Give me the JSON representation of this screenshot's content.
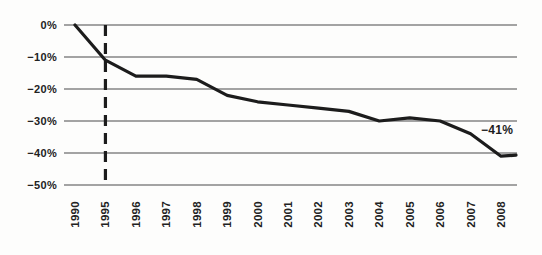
{
  "figure": {
    "background": "#fdfdfc",
    "title": ""
  },
  "chart_data": {
    "type": "line",
    "title": "",
    "xlabel": "",
    "ylabel": "",
    "categories": [
      "1990",
      "1995",
      "1996",
      "1997",
      "1998",
      "1999",
      "2000",
      "2001",
      "2002",
      "2003",
      "2004",
      "2005",
      "2006",
      "2007",
      "2008"
    ],
    "series": [
      {
        "name": "percent-change",
        "values": [
          0,
          -11,
          -16,
          -16,
          -17,
          -22,
          -24,
          -25,
          -26,
          -27,
          -30,
          -29,
          -30,
          -34,
          -41
        ]
      }
    ],
    "y_ticks": [
      0,
      -10,
      -20,
      -30,
      -40,
      -50
    ],
    "y_tick_labels": [
      "0%",
      "−10%",
      "−20%",
      "−30%",
      "−40%",
      "−50%"
    ],
    "ylim": [
      -50,
      0
    ],
    "grid": "horizontal",
    "legend": "none",
    "x_label_rotation": -90,
    "reference_line": {
      "category": "1995",
      "orientation": "vertical",
      "style": "dashed"
    },
    "annotation": {
      "text": "−41%",
      "category": "2008",
      "value": -41
    },
    "colors": {
      "line": "#1c1c1c",
      "grid": "#4a4a4a",
      "text": "#222222",
      "reference_line": "#1c1c1c",
      "annotation": "#1c1c1c"
    }
  }
}
